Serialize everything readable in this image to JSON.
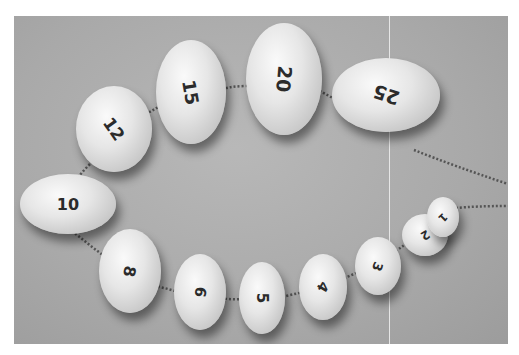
{
  "image": {
    "description": "Grayscale photo of a necklace of numbered white oval beads on a gray surface",
    "background_color": "#a9a9a9",
    "bead_color": "#e6e6e6",
    "text_color": "#2b2b2b"
  },
  "beads": [
    {
      "label": "25",
      "x": 318,
      "y": 42,
      "w": 108,
      "h": 74,
      "rot": 198,
      "fs": 19
    },
    {
      "label": "20",
      "x": 232,
      "y": 7,
      "w": 76,
      "h": 112,
      "rot": 95,
      "fs": 19
    },
    {
      "label": "15",
      "x": 142,
      "y": 24,
      "w": 70,
      "h": 104,
      "rot": 80,
      "fs": 18
    },
    {
      "label": "12",
      "x": 62,
      "y": 70,
      "w": 76,
      "h": 86,
      "rot": 55,
      "fs": 17
    },
    {
      "label": "10",
      "x": 6,
      "y": 158,
      "w": 96,
      "h": 60,
      "rot": 0,
      "fs": 16
    },
    {
      "label": "8",
      "x": 85,
      "y": 213,
      "w": 62,
      "h": 84,
      "rot": 100,
      "fs": 16
    },
    {
      "label": "6",
      "x": 160,
      "y": 238,
      "w": 52,
      "h": 76,
      "rot": 100,
      "fs": 15
    },
    {
      "label": "5",
      "x": 225,
      "y": 246,
      "w": 46,
      "h": 72,
      "rot": 90,
      "fs": 15
    },
    {
      "label": "4",
      "x": 285,
      "y": 238,
      "w": 48,
      "h": 66,
      "rot": 120,
      "fs": 14
    },
    {
      "label": "3",
      "x": 341,
      "y": 221,
      "w": 46,
      "h": 58,
      "rot": 110,
      "fs": 13
    },
    {
      "label": "2",
      "x": 388,
      "y": 198,
      "w": 46,
      "h": 42,
      "rot": 150,
      "fs": 12
    },
    {
      "label": "1",
      "x": 413,
      "y": 181,
      "w": 32,
      "h": 40,
      "rot": 135,
      "fs": 11
    }
  ]
}
